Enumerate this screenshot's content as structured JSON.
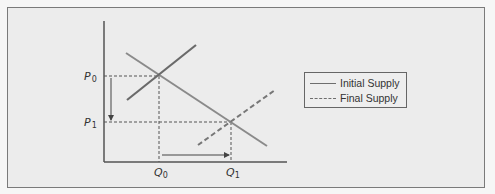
{
  "diagram": {
    "type": "supply-demand",
    "axis_labels": {
      "p0": "P",
      "p0_sub": "0",
      "p1": "P",
      "p1_sub": "1",
      "q0": "Q",
      "q0_sub": "0",
      "q1": "Q",
      "q1_sub": "1"
    },
    "legend": {
      "initial": "Initial Supply",
      "final": "Final Supply"
    },
    "colors": {
      "curve": "#7f7f7f",
      "initial_supply": "#6a6a6a",
      "axis": "#555555",
      "guide": "#555555",
      "background": "#ececec"
    }
  }
}
